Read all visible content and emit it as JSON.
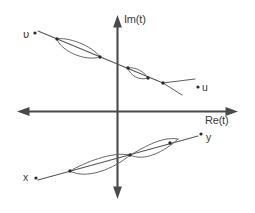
{
  "figure": {
    "type": "diagram",
    "background_color": "#ffffff",
    "ink_color": "#4a4a4a",
    "width": 255,
    "height": 213
  },
  "axes": {
    "vertical": {
      "label": "Im(t)",
      "name": "imaginary-axis",
      "x": 117,
      "y_top": 17,
      "y_bottom": 197,
      "arrow_top": true,
      "arrow_bottom": true
    },
    "horizontal": {
      "label": "Re(t)",
      "name": "real-axis",
      "y": 111,
      "x_left": 18,
      "x_right": 237,
      "arrow_left": true,
      "arrow_right": true
    },
    "origin": {
      "x": 117,
      "y": 111
    }
  },
  "contours": [
    {
      "name": "upper-contour",
      "start_label": "υ",
      "end_label": "u",
      "direction": "descending",
      "lens_count": 2,
      "node_count": 4
    },
    {
      "name": "lower-contour",
      "start_label": "x",
      "end_label": "y",
      "direction": "ascending",
      "lens_count": 2,
      "node_count": 3
    }
  ],
  "labels": {
    "im_axis": "Im(t)",
    "re_axis": "Re(t)",
    "upsilon": "υ",
    "u": "u",
    "y": "y",
    "x": "x"
  }
}
